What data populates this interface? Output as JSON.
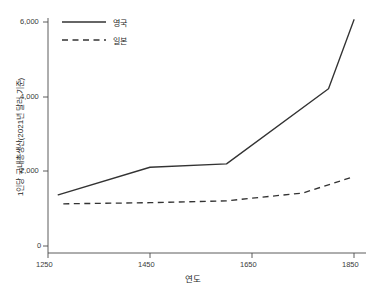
{
  "chart_data": {
    "type": "line",
    "title": "",
    "xlabel": "연도",
    "ylabel": "1인당 국내총생산(2021년 달러 기준)",
    "xlim": [
      1250,
      1870
    ],
    "ylim": [
      0,
      6400
    ],
    "xticks": [
      1250,
      1450,
      1650,
      1850
    ],
    "xtick_labels": [
      "1250",
      "1450",
      "1650",
      "1850"
    ],
    "yticks": [
      0,
      2000,
      4000,
      6000
    ],
    "ytick_labels": [
      "0",
      "2,000",
      "4,000",
      "6,000"
    ],
    "grid": false,
    "legend_position": "top-left",
    "series": [
      {
        "name": "영국",
        "style": "solid",
        "color": "#333333",
        "x": [
          1270,
          1450,
          1600,
          1800,
          1850
        ],
        "y": [
          1370,
          2110,
          2200,
          4210,
          6060
        ]
      },
      {
        "name": "일본",
        "style": "dashed",
        "color": "#333333",
        "x": [
          1280,
          1450,
          1600,
          1750,
          1850
        ],
        "y": [
          1130,
          1160,
          1210,
          1420,
          1860
        ]
      }
    ]
  },
  "legend": {
    "entries": [
      {
        "label": "영국",
        "style": "solid"
      },
      {
        "label": "일본",
        "style": "dashed"
      }
    ]
  },
  "axes": {
    "y_title": "1인당 국내총생산(2021년 달러 기준)",
    "x_title": "연도",
    "y_ticks": [
      "6,000",
      "4,000",
      "2,000",
      "0"
    ],
    "x_ticks": [
      "1250",
      "1450",
      "1650",
      "1850"
    ]
  }
}
